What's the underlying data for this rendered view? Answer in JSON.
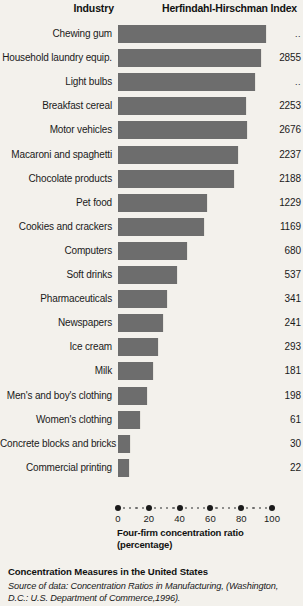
{
  "header": {
    "industry_label": "Industry",
    "index_label": "Herfindahl-Hirschman Index"
  },
  "axis": {
    "title_line1": "Four-firm concentration ratio",
    "title_line2": "(percentage)",
    "ticks": [
      "0",
      "20",
      "40",
      "60",
      "80",
      "100"
    ],
    "min": 0,
    "max": 100
  },
  "caption": {
    "title": "Concentration Measures in the United States",
    "source_prefix": "Source of data: ",
    "source_italic": "Concentration Ratios in Manufacturing,",
    "source_suffix": " (Washington, D.C.: U.S. Department of Commerce,1996)."
  },
  "colors": {
    "bar": "#6d6d6d",
    "background": "#f3f1ec",
    "text": "#1a1a1a"
  },
  "chart_data": {
    "type": "bar",
    "orientation": "horizontal",
    "title": "Concentration Measures in the United States",
    "xlabel": "Four-firm concentration ratio (percentage)",
    "ylabel": "Industry",
    "xlim": [
      0,
      100
    ],
    "xticks": [
      0,
      20,
      40,
      60,
      80,
      100
    ],
    "grid": false,
    "legend": "none",
    "value_column_label": "Herfindahl-Hirschman Index",
    "categories": [
      "Chewing gum",
      "Household laundry equip.",
      "Light bulbs",
      "Breakfast cereal",
      "Motor vehicles",
      "Macaroni and spaghetti",
      "Chocolate products",
      "Pet food",
      "Cookies and crackers",
      "Computers",
      "Soft drinks",
      "Pharmaceuticals",
      "Newspapers",
      "Ice cream",
      "Milk",
      "Men's and boy's clothing",
      "Women's clothing",
      "Concrete blocks and bricks",
      "Commercial printing"
    ],
    "values": [
      96,
      93,
      89,
      83,
      84,
      78,
      75,
      58,
      56,
      45,
      38,
      32,
      29,
      26,
      23,
      19,
      14,
      8,
      7
    ],
    "hhi": [
      "..",
      "2855",
      "..",
      "2253",
      "2676",
      "2237",
      "2188",
      "1229",
      "1169",
      "680",
      "537",
      "341",
      "241",
      "293",
      "181",
      "198",
      "61",
      "30",
      "22"
    ]
  }
}
